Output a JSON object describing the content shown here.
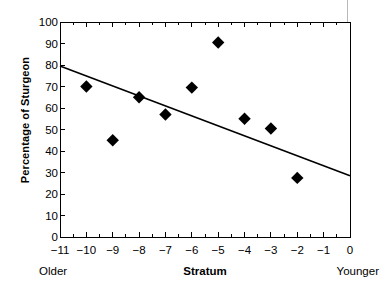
{
  "chart_data": {
    "type": "scatter",
    "title": "",
    "xlabel": "Stratum",
    "ylabel": "Percentage of Sturgeon",
    "xlim": [
      -11,
      0
    ],
    "ylim": [
      0,
      100
    ],
    "grid": false,
    "legend": null,
    "x_tick_labels": [
      "−11",
      "−10",
      "−9",
      "−8",
      "−7",
      "−6",
      "−5",
      "−4",
      "−3",
      "−2",
      "−1",
      "0"
    ],
    "x_tick_values": [
      -11,
      -10,
      -9,
      -8,
      -7,
      -6,
      -5,
      -4,
      -3,
      -2,
      -1,
      0
    ],
    "y_tick_labels": [
      "0",
      "10",
      "20",
      "30",
      "40",
      "50",
      "60",
      "70",
      "80",
      "90",
      "100"
    ],
    "y_tick_values": [
      0,
      10,
      20,
      30,
      40,
      50,
      60,
      70,
      80,
      90,
      100
    ],
    "minor_tick_step_x": 0.5,
    "points": [
      {
        "x": -10,
        "y": 70
      },
      {
        "x": -9,
        "y": 45
      },
      {
        "x": -8,
        "y": 65
      },
      {
        "x": -7,
        "y": 57
      },
      {
        "x": -6,
        "y": 69.5
      },
      {
        "x": -5,
        "y": 90.5
      },
      {
        "x": -4,
        "y": 55
      },
      {
        "x": -3,
        "y": 50.5
      },
      {
        "x": -2,
        "y": 27.5
      }
    ],
    "marker": "diamond",
    "marker_color": "#000000",
    "trendline": {
      "x_start": -11,
      "y_start": 79.5,
      "x_end": 0,
      "y_end": 28.5,
      "color": "#000000"
    },
    "annotations": [
      {
        "text": "Older",
        "position": "x-axis-left-end"
      },
      {
        "text": "Younger",
        "position": "x-axis-right-end"
      }
    ]
  },
  "axis": {
    "frame_color": "#000000"
  }
}
